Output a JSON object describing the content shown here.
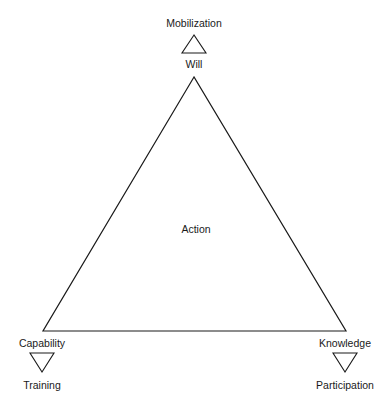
{
  "diagram": {
    "center_label": "Action",
    "vertices": {
      "top": {
        "label": "Will",
        "outcome": "Mobilization"
      },
      "left": {
        "label": "Capability",
        "outcome": "Training"
      },
      "right": {
        "label": "Knowledge",
        "outcome": "Participation"
      }
    },
    "colors": {
      "stroke": "#1a1a1a",
      "background": "#ffffff"
    }
  }
}
